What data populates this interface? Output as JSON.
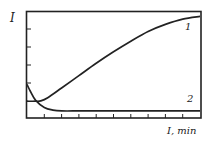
{
  "chart_data": {
    "type": "line",
    "title": "",
    "xlabel": "I, min",
    "ylabel": "I",
    "x_ticks_count": 9,
    "y_ticks_count": 4,
    "tick_labels_shown": false,
    "grid": false,
    "legend": "inline curve labels",
    "xlim": [
      0,
      10
    ],
    "ylim": [
      0,
      6
    ],
    "series": [
      {
        "name": "1",
        "x": [
          0,
          0.5,
          0.8,
          1.2,
          2,
          3,
          4,
          5,
          6,
          7,
          8,
          9,
          10
        ],
        "y": [
          0.95,
          0.95,
          0.97,
          1.15,
          1.7,
          2.4,
          3.1,
          3.75,
          4.35,
          4.9,
          5.3,
          5.6,
          5.75
        ]
      },
      {
        "name": "2",
        "x": [
          0,
          0.2,
          0.5,
          1,
          1.5,
          2,
          3,
          4,
          5,
          6,
          7,
          8,
          9,
          10
        ],
        "y": [
          1.9,
          1.5,
          1.0,
          0.6,
          0.45,
          0.4,
          0.4,
          0.4,
          0.4,
          0.4,
          0.4,
          0.4,
          0.4,
          0.4
        ]
      }
    ]
  },
  "labels": {
    "y_axis": "I",
    "x_axis": "I, min",
    "curve1": "1",
    "curve2": "2"
  },
  "colors": {
    "line": "#222222",
    "axis": "#222222",
    "background": "#ffffff"
  }
}
